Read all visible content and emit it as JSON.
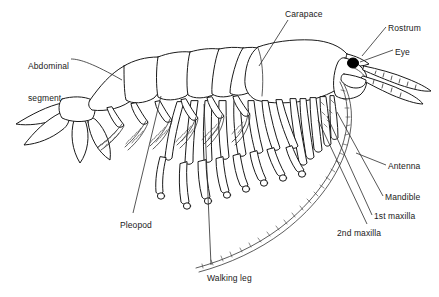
{
  "diagram": {
    "background_color": "#ffffff",
    "line_color": "#1a1a1a",
    "eye_color": "#000000",
    "labels": [
      {
        "id": "abdominal-segment",
        "text": "Abdominal\nsegment",
        "line1": "Abdominal",
        "line2": "segment",
        "x": 28,
        "y": 40
      },
      {
        "id": "carapace",
        "text": "Carapace",
        "x": 285,
        "y": 9
      },
      {
        "id": "rostrum",
        "text": "Rostrum",
        "x": 388,
        "y": 23
      },
      {
        "id": "eye",
        "text": "Eye",
        "x": 395,
        "y": 47
      },
      {
        "id": "antenna",
        "text": "Antenna",
        "x": 388,
        "y": 161
      },
      {
        "id": "mandible",
        "text": "Mandible",
        "x": 385,
        "y": 192
      },
      {
        "id": "first-maxilla",
        "text": "1st maxilla",
        "x": 374,
        "y": 211
      },
      {
        "id": "second-maxilla",
        "text": "2nd maxilla",
        "x": 337,
        "y": 228
      },
      {
        "id": "pleopod",
        "text": "Pleopod",
        "x": 120,
        "y": 220
      },
      {
        "id": "walking-leg",
        "text": "Walking leg",
        "x": 207,
        "y": 273
      }
    ]
  }
}
